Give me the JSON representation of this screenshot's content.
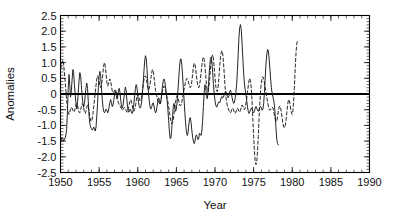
{
  "chart_data": {
    "type": "line",
    "title": "",
    "xlabel": "Year",
    "ylabel": "Anomalies",
    "xlim": [
      1950,
      1990
    ],
    "ylim": [
      -2.5,
      2.5
    ],
    "grid": false,
    "legend": "none",
    "x_ticks": [
      1950,
      1955,
      1960,
      1965,
      1970,
      1975,
      1980,
      1985,
      1990
    ],
    "x_tick_labels": [
      "1950",
      "1955",
      "1960",
      "1965",
      "1970",
      "1975",
      "1980",
      "1985",
      "1990"
    ],
    "x_minor_tick_step": 1,
    "y_ticks": [
      -2.5,
      -2.0,
      -1.5,
      -1.0,
      -0.5,
      0,
      0.5,
      1.0,
      1.5,
      2.0,
      2.5
    ],
    "y_tick_labels": [
      "-2.5",
      "-2.0",
      "-1.5",
      "-1.0",
      "-0.5",
      "0",
      "0.5",
      "1.0",
      "1.5",
      "2.0",
      "2.5"
    ],
    "y_minor_tick_step": 0.1,
    "zero_reference_line": 0,
    "annotations": [],
    "series": [
      {
        "name": "solid-series",
        "style": "solid",
        "color": "#1a1a1a",
        "x_start": 1950.0,
        "x_end": 1988.7,
        "x_step": 0.1,
        "values": [
          -1.45,
          -1.52,
          -1.38,
          -1.42,
          -1.5,
          -1.46,
          -1.4,
          -1.3,
          -1.1,
          -0.55,
          0.15,
          0.62,
          0.3,
          -0.1,
          0.1,
          0.45,
          0.78,
          0.68,
          0.3,
          0.0,
          -0.3,
          -0.48,
          -0.28,
          0.05,
          0.42,
          0.68,
          0.6,
          0.28,
          -0.05,
          -0.3,
          -0.42,
          -0.3,
          -0.05,
          0.2,
          0.35,
          0.18,
          -0.25,
          -0.7,
          -0.95,
          -1.05,
          -1.1,
          -1.15,
          -1.12,
          -1.05,
          -1.12,
          -1.18,
          -1.05,
          -0.7,
          -0.3,
          0.2,
          0.58,
          0.72,
          0.55,
          0.2,
          -0.15,
          -0.42,
          -0.55,
          -0.6,
          -0.55,
          -0.48,
          -0.52,
          -0.6,
          -0.55,
          -0.4,
          -0.25,
          -0.18,
          -0.28,
          -0.4,
          -0.35,
          -0.2,
          -0.02,
          0.08,
          0.0,
          -0.15,
          -0.1,
          0.1,
          0.18,
          0.05,
          -0.2,
          -0.4,
          -0.45,
          -0.35,
          -0.15,
          0.05,
          0.22,
          0.1,
          -0.2,
          -0.45,
          -0.58,
          -0.55,
          -0.48,
          -0.5,
          -0.6,
          -0.62,
          -0.52,
          -0.3,
          -0.05,
          0.18,
          0.3,
          0.2,
          -0.05,
          -0.28,
          -0.4,
          -0.45,
          -0.4,
          -0.25,
          0.0,
          0.35,
          0.72,
          1.05,
          1.22,
          1.12,
          0.78,
          0.35,
          0.0,
          -0.25,
          -0.42,
          -0.48,
          -0.42,
          -0.32,
          -0.28,
          -0.38,
          -0.52,
          -0.6,
          -0.55,
          -0.4,
          -0.22,
          -0.12,
          -0.2,
          -0.32,
          -0.25,
          0.0,
          0.25,
          0.42,
          0.48,
          0.4,
          0.22,
          0.02,
          -0.2,
          -0.48,
          -0.85,
          -1.2,
          -1.42,
          -1.4,
          -1.12,
          -0.72,
          -0.4,
          -0.3,
          -0.42,
          -0.55,
          -0.48,
          -0.25,
          0.1,
          0.48,
          0.85,
          1.08,
          1.12,
          0.95,
          0.6,
          0.2,
          -0.2,
          -0.6,
          -0.95,
          -1.2,
          -1.32,
          -1.25,
          -1.02,
          -0.8,
          -0.75,
          -0.9,
          -1.15,
          -1.38,
          -1.5,
          -1.58,
          -1.52,
          -1.35,
          -1.3,
          -1.38,
          -1.45,
          -1.4,
          -1.25,
          -1.28,
          -1.32,
          -1.18,
          -0.85,
          -0.4,
          0.05,
          0.3,
          0.2,
          -0.05,
          -0.15,
          0.05,
          0.45,
          0.85,
          1.1,
          1.17,
          1.02,
          0.68,
          0.3,
          0.0,
          -0.22,
          -0.35,
          -0.42,
          -0.38,
          -0.3,
          -0.25,
          -0.28,
          -0.22,
          -0.12,
          -0.08,
          -0.12,
          -0.1,
          -0.02,
          0.05,
          0.08,
          0.02,
          -0.08,
          -0.12,
          -0.05,
          0.08,
          0.12,
          0.05,
          -0.1,
          -0.22,
          -0.3,
          -0.28,
          -0.15,
          0.05,
          0.3,
          0.72,
          1.25,
          1.8,
          2.12,
          2.21,
          2.05,
          1.65,
          1.15,
          0.7,
          0.35,
          0.15,
          0.0,
          -0.2,
          -0.4,
          -0.55,
          -0.62,
          -0.58,
          -0.5,
          -0.45,
          -0.48,
          -0.55,
          -0.6,
          -0.55,
          -0.45,
          -0.4,
          -0.45,
          -0.52,
          -0.55,
          -0.5,
          -0.42,
          -0.4,
          -0.45,
          -0.52,
          -0.48,
          -0.3,
          0.05,
          0.5,
          0.95,
          1.25,
          1.42,
          1.38,
          1.15,
          0.82,
          0.48,
          0.2,
          0.02,
          -0.1,
          -0.2,
          -0.38,
          -0.7,
          -1.12,
          -1.45,
          -1.58,
          -1.62
        ]
      },
      {
        "name": "dashed-series",
        "style": "dashed",
        "color": "#1a1a1a",
        "x_start": 1950.0,
        "x_end": 1988.7,
        "x_step": 0.1,
        "values": [
          0.78,
          0.88,
          1.02,
          1.08,
          0.95,
          0.7,
          0.4,
          0.1,
          -0.2,
          -0.45,
          -0.6,
          -0.65,
          -0.58,
          -0.48,
          -0.42,
          -0.45,
          -0.52,
          -0.58,
          -0.55,
          -0.45,
          -0.35,
          -0.3,
          -0.35,
          -0.48,
          -0.58,
          -0.6,
          -0.52,
          -0.4,
          -0.3,
          -0.32,
          -0.45,
          -0.58,
          -0.62,
          -0.55,
          -0.42,
          -0.35,
          -0.4,
          -0.55,
          -0.72,
          -0.85,
          -0.88,
          -0.8,
          -0.62,
          -0.4,
          -0.18,
          0.05,
          0.28,
          0.48,
          0.58,
          0.52,
          0.38,
          0.25,
          0.2,
          0.28,
          0.45,
          0.7,
          0.92,
          1.0,
          0.88,
          0.62,
          0.38,
          0.25,
          0.3,
          0.42,
          0.48,
          0.4,
          0.25,
          0.1,
          0.02,
          0.05,
          0.12,
          0.15,
          0.08,
          -0.05,
          -0.18,
          -0.28,
          -0.35,
          -0.38,
          -0.42,
          -0.48,
          -0.52,
          -0.5,
          -0.45,
          -0.42,
          -0.45,
          -0.52,
          -0.58,
          -0.55,
          -0.45,
          -0.32,
          -0.22,
          -0.18,
          -0.25,
          -0.38,
          -0.5,
          -0.55,
          -0.5,
          -0.38,
          -0.22,
          -0.08,
          0.0,
          -0.05,
          -0.15,
          -0.22,
          -0.2,
          -0.1,
          0.08,
          0.28,
          0.45,
          0.55,
          0.58,
          0.5,
          0.35,
          0.2,
          0.12,
          0.18,
          0.32,
          0.5,
          0.68,
          0.78,
          0.72,
          0.55,
          0.32,
          0.12,
          0.0,
          -0.1,
          -0.2,
          -0.28,
          -0.32,
          -0.28,
          -0.18,
          -0.05,
          0.08,
          0.18,
          0.25,
          0.22,
          0.12,
          0.0,
          -0.12,
          -0.25,
          -0.4,
          -0.58,
          -0.75,
          -0.88,
          -0.95,
          -0.92,
          -0.8,
          -0.62,
          -0.42,
          -0.25,
          -0.12,
          -0.05,
          -0.1,
          -0.22,
          -0.32,
          -0.38,
          -0.35,
          -0.25,
          -0.12,
          0.02,
          0.15,
          0.28,
          0.4,
          0.48,
          0.5,
          0.45,
          0.35,
          0.25,
          0.2,
          0.25,
          0.4,
          0.62,
          0.85,
          0.98,
          0.95,
          0.8,
          0.58,
          0.38,
          0.25,
          0.2,
          0.28,
          0.45,
          0.68,
          0.92,
          1.1,
          1.18,
          1.1,
          0.88,
          0.58,
          0.3,
          0.12,
          0.08,
          0.2,
          0.45,
          0.75,
          1.02,
          1.2,
          1.25,
          1.12,
          0.85,
          0.52,
          0.25,
          0.1,
          0.08,
          0.22,
          0.5,
          0.85,
          1.15,
          1.32,
          1.38,
          1.28,
          1.0,
          0.62,
          0.25,
          -0.05,
          -0.25,
          -0.38,
          -0.45,
          -0.52,
          -0.58,
          -0.6,
          -0.55,
          -0.48,
          -0.45,
          -0.5,
          -0.58,
          -0.62,
          -0.58,
          -0.5,
          -0.45,
          -0.48,
          -0.55,
          -0.58,
          -0.52,
          -0.42,
          -0.35,
          -0.38,
          -0.45,
          -0.5,
          -0.45,
          -0.32,
          -0.15,
          0.05,
          0.25,
          0.42,
          0.5,
          0.42,
          0.18,
          -0.25,
          -0.8,
          -1.35,
          -1.82,
          -2.12,
          -2.25,
          -2.18,
          -1.85,
          -1.35,
          -0.8,
          -0.3,
          0.1,
          0.38,
          0.52,
          0.55,
          0.48,
          0.35,
          0.2,
          0.05,
          -0.1,
          -0.25,
          -0.38,
          -0.48,
          -0.52,
          -0.5,
          -0.45,
          -0.42,
          -0.45,
          -0.55,
          -0.68,
          -0.8,
          -0.88,
          -0.85,
          -0.72,
          -0.55,
          -0.42,
          -0.38,
          -0.45,
          -0.6,
          -0.78,
          -0.95,
          -1.05,
          -1.08,
          -1.0,
          -0.82,
          -0.58,
          -0.35,
          -0.2,
          -0.18,
          -0.3,
          -0.48,
          -0.62,
          -0.65,
          -0.5,
          -0.15,
          0.35,
          0.9,
          1.35,
          1.62,
          1.72
        ]
      }
    ]
  },
  "axis": {
    "y_title": "Anomalies",
    "x_title": "Year"
  }
}
